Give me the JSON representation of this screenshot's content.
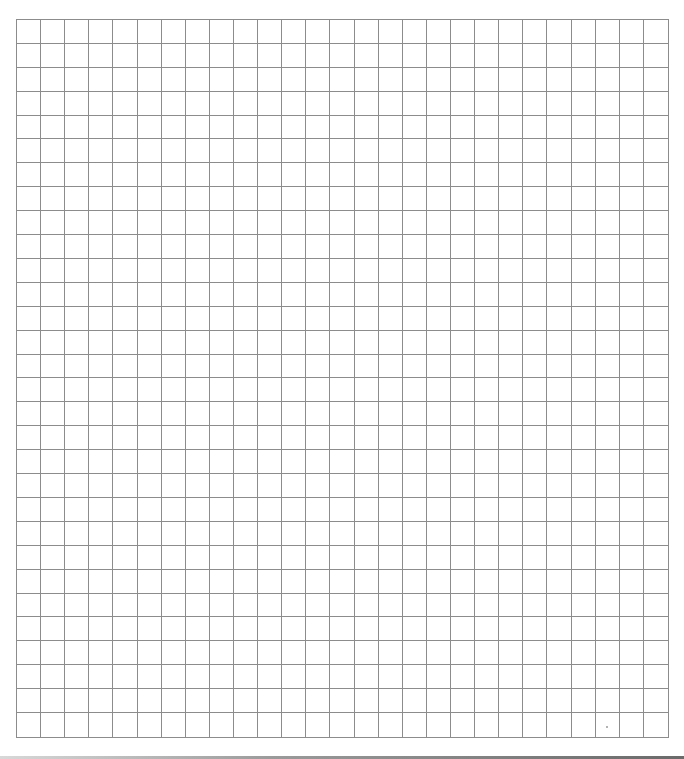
{
  "document": {
    "type": "blank-grid-sheet",
    "grid": {
      "columns": 27,
      "rows": 30,
      "cell_size_px": 24,
      "line_color": "#8c8c8c",
      "background_color": "#ffffff"
    }
  }
}
